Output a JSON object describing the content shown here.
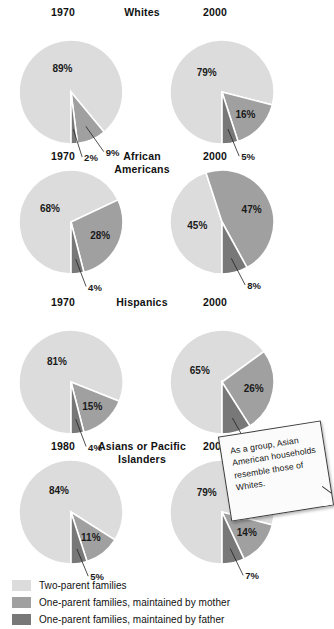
{
  "colors": {
    "two_parent": "#dcdcdc",
    "mother": "#a0a0a0",
    "father": "#787878",
    "separator": "#ffffff",
    "text": "#111111",
    "note_bg": "#fbfbfb",
    "note_border": "#3a3a3a",
    "background": "#ffffff"
  },
  "legend": {
    "items": [
      {
        "swatch": "two_parent",
        "label": "Two-parent families"
      },
      {
        "swatch": "mother",
        "label": "One-parent families, maintained by mother"
      },
      {
        "swatch": "father",
        "label": "One-parent families, maintained by father"
      }
    ]
  },
  "note": {
    "text": "As a group, Asian American households resemble those of Whites."
  },
  "chart_data": {
    "type": "pie",
    "series_names": [
      "Two-parent families",
      "One-parent families, maintained by mother",
      "One-parent families, maintained by father"
    ],
    "value_suffix": "%",
    "groups": [
      {
        "name": "Whites",
        "title_lines": [
          "Whites"
        ],
        "charts": [
          {
            "year": "1970",
            "labels": [
              "89%",
              "9%",
              "2%"
            ],
            "values": [
              89,
              9,
              2
            ],
            "categories": [
              "Two-parent families",
              "One-parent families, maintained by mother",
              "One-parent families, maintained by father"
            ]
          },
          {
            "year": "2000",
            "labels": [
              "79%",
              "16%",
              "5%"
            ],
            "values": [
              79,
              16,
              5
            ],
            "categories": [
              "Two-parent families",
              "One-parent families, maintained by mother",
              "One-parent families, maintained by father"
            ]
          }
        ]
      },
      {
        "name": "African Americans",
        "title_lines": [
          "African",
          "Americans"
        ],
        "charts": [
          {
            "year": "1970",
            "labels": [
              "68%",
              "28%",
              "4%"
            ],
            "values": [
              68,
              28,
              4
            ],
            "categories": [
              "Two-parent families",
              "One-parent families, maintained by mother",
              "One-parent families, maintained by father"
            ]
          },
          {
            "year": "2000",
            "labels": [
              "45%",
              "47%",
              "8%"
            ],
            "values": [
              45,
              47,
              8
            ],
            "categories": [
              "Two-parent families",
              "One-parent families, maintained by mother",
              "One-parent families, maintained by father"
            ]
          }
        ]
      },
      {
        "name": "Hispanics",
        "title_lines": [
          "Hispanics"
        ],
        "charts": [
          {
            "year": "1970",
            "labels": [
              "81%",
              "15%",
              "4%"
            ],
            "values": [
              81,
              15,
              4
            ],
            "categories": [
              "Two-parent families",
              "One-parent families, maintained by mother",
              "One-parent families, maintained by father"
            ]
          },
          {
            "year": "2000",
            "labels": [
              "65%",
              "26%",
              "9%"
            ],
            "values": [
              65,
              26,
              9
            ],
            "categories": [
              "Two-parent families",
              "One-parent families, maintained by mother",
              "One-parent families, maintained by father"
            ]
          }
        ]
      },
      {
        "name": "Asians or Pacific Islanders",
        "title_lines": [
          "Asians or Pacific",
          "Islanders"
        ],
        "charts": [
          {
            "year": "1980",
            "labels": [
              "84%",
              "11%",
              "5%"
            ],
            "values": [
              84,
              11,
              5
            ],
            "categories": [
              "Two-parent families",
              "One-parent families, maintained by mother",
              "One-parent families, maintained by father"
            ]
          },
          {
            "year": "2000",
            "labels": [
              "79%",
              "14%",
              "7%"
            ],
            "values": [
              79,
              14,
              7
            ],
            "categories": [
              "Two-parent families",
              "One-parent families, maintained by mother",
              "One-parent families, maintained by father"
            ]
          }
        ]
      }
    ]
  }
}
